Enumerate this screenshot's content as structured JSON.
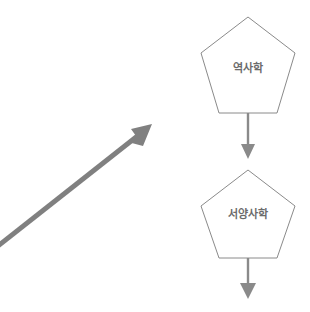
{
  "diagram": {
    "background_color": "#ffffff",
    "node_fill": "#ffffff",
    "node_stroke": "#8a8a8a",
    "connector_color": "#8a8a8a",
    "big_arrow_color": "#808080",
    "label_color": "#6b6b6b",
    "nodes": [
      {
        "id": "node-history",
        "shape": "pentagon",
        "label": "역사학",
        "center_x": 248,
        "center_y": 65
      },
      {
        "id": "node-western-history",
        "shape": "pentagon",
        "label": "서양사학",
        "center_x": 248,
        "center_y": 218
      }
    ],
    "connectors": [
      {
        "id": "connector-history-to-western",
        "direction": "down",
        "from": "node-history",
        "to": "node-western-history"
      },
      {
        "id": "connector-western-outgoing",
        "direction": "down",
        "from": "node-western-history",
        "to": ""
      }
    ],
    "big_arrow": {
      "id": "big-diagonal-arrow",
      "direction": "up-right",
      "start_x": 0,
      "start_y": 245,
      "end_x": 150,
      "end_y": 127
    }
  }
}
